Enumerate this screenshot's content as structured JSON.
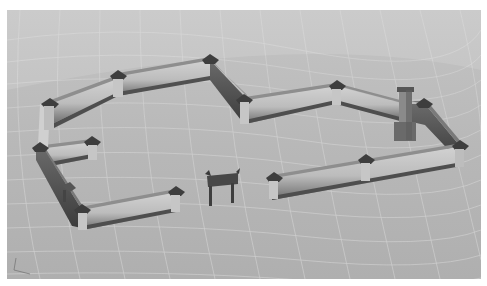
{
  "image": {
    "subject": "3D rendering of a walled courtyard compound with corner pavilions, a chimney/tower, and a freestanding gateway",
    "style": "grayscale architectural visualization on a curved grid ground plane",
    "colors": {
      "ground": "#b9b9b9",
      "grid_line": "#d6d6d6",
      "wall_face": "#c8c8c8",
      "wall_top": "#9a9a9a",
      "wall_shadow": "#5a5a5a",
      "roof": "#3e3e3e",
      "border": "#ffffff"
    }
  },
  "scene": {
    "walls": [
      {
        "name": "north-west-wall"
      },
      {
        "name": "north-wall"
      },
      {
        "name": "north-diagonal-wall"
      },
      {
        "name": "north-east-wall"
      },
      {
        "name": "east-wall"
      },
      {
        "name": "south-east-wall"
      },
      {
        "name": "west-wall"
      },
      {
        "name": "south-west-wall"
      },
      {
        "name": "inner-west-wall"
      }
    ],
    "gateway": {
      "name": "freestanding-gate"
    },
    "tower": {
      "name": "chimney-tower"
    }
  }
}
